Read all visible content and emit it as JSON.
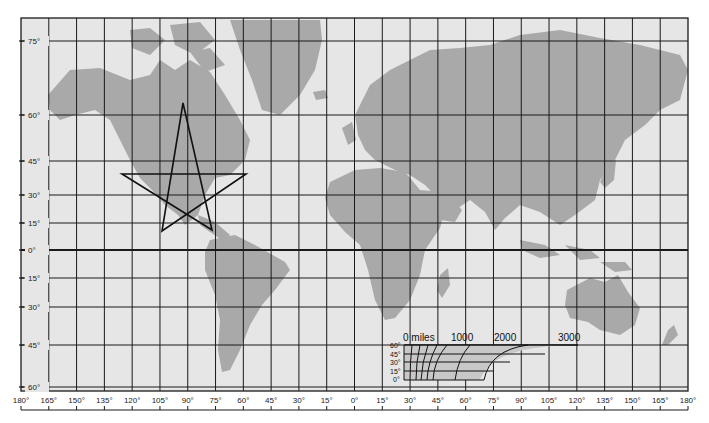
{
  "map": {
    "type": "Mercator world map with graticule",
    "colors": {
      "ocean": "#e6e6e6",
      "land": "#a9a9a9",
      "grid": "#1a1a1a",
      "background": "#ffffff",
      "star": "#111111"
    },
    "frame": {
      "left": 21,
      "right": 688,
      "top": 18,
      "bottom": 391
    },
    "latitude_lines": [
      {
        "label": "75°",
        "y": 41
      },
      {
        "label": "60°",
        "y": 115
      },
      {
        "label": "45°",
        "y": 161
      },
      {
        "label": "30°",
        "y": 195
      },
      {
        "label": "15°",
        "y": 223
      },
      {
        "label": "0°",
        "y": 250,
        "equator": true
      },
      {
        "label": "15°",
        "y": 278
      },
      {
        "label": "30°",
        "y": 307
      },
      {
        "label": "45°",
        "y": 345
      },
      {
        "label": "60°",
        "y": 387
      }
    ],
    "longitude_labels": [
      "180°",
      "165°",
      "150°",
      "135°",
      "120°",
      "105°",
      "90°",
      "75°",
      "60°",
      "45°",
      "30°",
      "15°",
      "0°",
      "15°",
      "30°",
      "45°",
      "60°",
      "75°",
      "90°",
      "105°",
      "120°",
      "135°",
      "150°",
      "165°",
      "180°"
    ],
    "annotation_star": {
      "description": "five-pointed star drawn over North America",
      "points": [
        [
          183,
          103
        ],
        [
          212,
          230
        ],
        [
          122,
          174
        ],
        [
          246,
          174
        ],
        [
          162,
          231
        ]
      ]
    },
    "scale_inset": {
      "distance_labels": [
        "0 miles",
        "1000",
        "2000",
        "3000"
      ],
      "latitude_labels": [
        "60°",
        "45°",
        "30°",
        "15°",
        "0°"
      ]
    }
  }
}
